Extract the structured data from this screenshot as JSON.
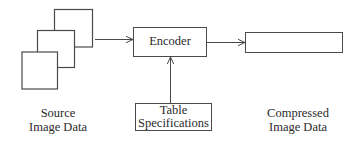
{
  "diagram": {
    "type": "block-diagram",
    "nodes": {
      "source": {
        "label_line1": "Source",
        "label_line2": "Image Data",
        "shape": "stacked-squares"
      },
      "encoder": {
        "label": "Encoder"
      },
      "tables": {
        "label_line1": "Table",
        "label_line2": "Specifications"
      },
      "output": {
        "label_line1": "Compressed",
        "label_line2": "Image Data",
        "shape": "empty-rectangle"
      }
    },
    "edges": [
      {
        "from": "source",
        "to": "encoder"
      },
      {
        "from": "encoder",
        "to": "output"
      },
      {
        "from": "tables",
        "to": "encoder"
      }
    ],
    "colors": {
      "stroke": "#4a4a4a",
      "text": "#2a2a2a",
      "background": "#ffffff"
    }
  }
}
